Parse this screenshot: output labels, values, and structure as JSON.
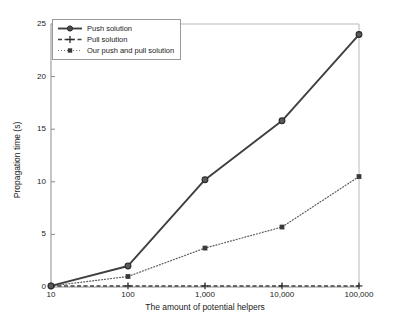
{
  "chart_data": {
    "type": "line",
    "title": "",
    "xlabel": "The amount of potential helpers",
    "ylabel": "Propagation time (s)",
    "x": [
      10,
      100,
      1000,
      10000,
      100000
    ],
    "xtick_labels": [
      "10",
      "100",
      "1,000",
      "10,000",
      "100,000"
    ],
    "xscale": "log",
    "ytick_labels": [
      "0",
      "5",
      "10",
      "15",
      "20",
      "25"
    ],
    "ytick_values": [
      0,
      5,
      10,
      15,
      20,
      25
    ],
    "ylim": [
      0,
      25
    ],
    "grid": false,
    "legend_position": "upper left",
    "series": [
      {
        "name": "Push solution",
        "values": [
          0.1,
          2.0,
          10.2,
          15.8,
          24.0
        ],
        "line_style": "solid",
        "marker": "circle",
        "color": "#3f3f3f"
      },
      {
        "name": "Pull solution",
        "values": [
          0.1,
          0.1,
          0.1,
          0.1,
          0.1
        ],
        "line_style": "dashed",
        "marker": "plus",
        "color": "#3f3f3f"
      },
      {
        "name": "Our push and pull solution",
        "values": [
          0.1,
          1.0,
          3.7,
          5.7,
          10.5
        ],
        "line_style": "dotted",
        "marker": "square",
        "color": "#4a4a4a"
      }
    ]
  },
  "axes": {
    "frame_color": "#8c8c8c"
  }
}
